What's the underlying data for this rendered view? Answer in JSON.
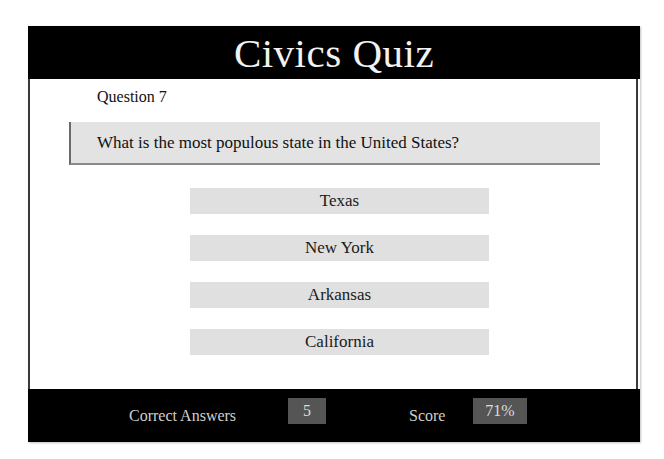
{
  "header": {
    "title": "Civics Quiz"
  },
  "question": {
    "number_label": "Question 7",
    "text": "What is the most populous state in the United States?"
  },
  "answers": [
    {
      "label": "Texas"
    },
    {
      "label": "New York"
    },
    {
      "label": "Arkansas"
    },
    {
      "label": "California"
    }
  ],
  "footer": {
    "correct_label": "Correct Answers",
    "correct_value": "5",
    "score_label": "Score",
    "score_value": "71%"
  },
  "colors": {
    "header_bg": "#000000",
    "button_bg": "#e0e0e0",
    "value_box_bg": "#555555"
  }
}
